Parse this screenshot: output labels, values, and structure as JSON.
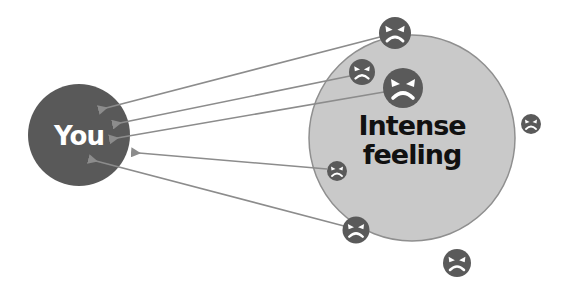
{
  "diagram": {
    "type": "concept-diagram",
    "colors": {
      "you_circle": "#595959",
      "feeling_circle": "#c9c9c9",
      "feeling_stroke": "#8f8f8f",
      "face": "#5a5a5a",
      "arrow": "#8c8c8c",
      "background": "#ffffff"
    },
    "nodes": {
      "you": {
        "label": "You"
      },
      "feeling": {
        "line1": "Intense",
        "line2": "feeling"
      }
    },
    "faces": [
      {
        "id": "face-1",
        "icon": "angry-face-icon",
        "arrow_to_you": true
      },
      {
        "id": "face-2",
        "icon": "angry-face-icon",
        "arrow_to_you": true
      },
      {
        "id": "face-3",
        "icon": "angry-face-icon",
        "arrow_to_you": true
      },
      {
        "id": "face-4",
        "icon": "angry-face-icon",
        "arrow_to_you": true
      },
      {
        "id": "face-5",
        "icon": "angry-face-icon",
        "arrow_to_you": true
      },
      {
        "id": "face-6",
        "icon": "angry-face-icon",
        "arrow_to_you": false
      },
      {
        "id": "face-7",
        "icon": "angry-face-icon",
        "arrow_to_you": false
      }
    ],
    "arrow_count": 5
  }
}
